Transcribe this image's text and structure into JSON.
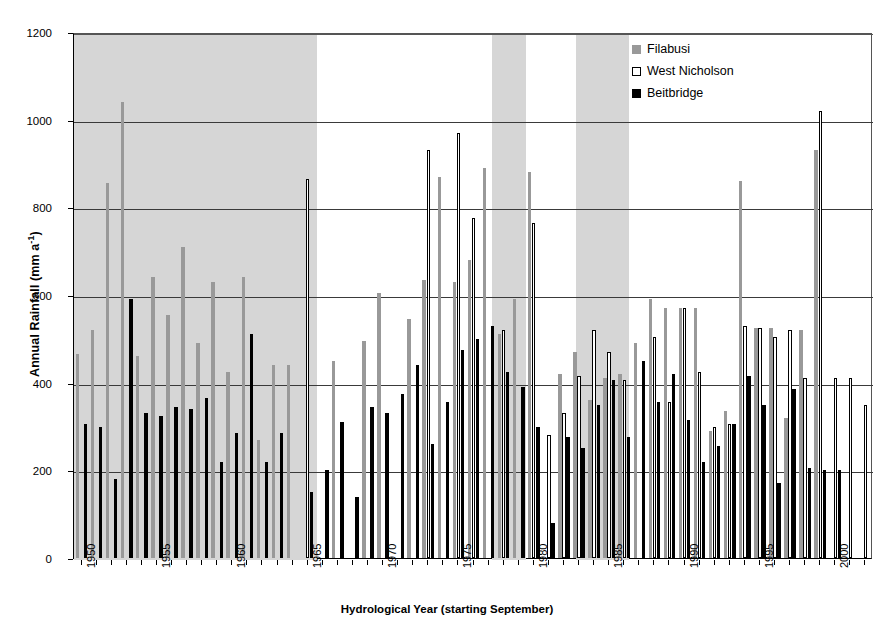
{
  "chart_data": {
    "type": "bar",
    "title": "",
    "xlabel": "Hydrological  Year (starting September)",
    "ylabel": "Annual Rainfall (mm a",
    "ylabel_sup": "-1",
    "ylabel_suffix": ")",
    "ylim": [
      0,
      1200
    ],
    "ytick_values": [
      0,
      200,
      400,
      600,
      800,
      1000,
      1200
    ],
    "ytick_labels": [
      "0",
      "200",
      "400",
      "600",
      "800",
      "1000",
      "1200"
    ],
    "grid": "horizontal",
    "legend_position": "top-right",
    "legend": [
      {
        "name": "Filabusi",
        "color": "#999999"
      },
      {
        "name": "West Nicholson",
        "color": "#ffffff"
      },
      {
        "name": "Beitbridge",
        "color": "#000000"
      }
    ],
    "xlim": [
      1949.5,
      2002.5
    ],
    "x": [
      1950,
      1951,
      1952,
      1953,
      1954,
      1955,
      1956,
      1957,
      1958,
      1959,
      1960,
      1961,
      1962,
      1963,
      1964,
      1965,
      1966,
      1967,
      1968,
      1969,
      1970,
      1971,
      1972,
      1973,
      1974,
      1975,
      1976,
      1977,
      1978,
      1979,
      1980,
      1981,
      1982,
      1983,
      1984,
      1985,
      1986,
      1987,
      1988,
      1989,
      1990,
      1991,
      1992,
      1993,
      1994,
      1995,
      1996,
      1997,
      1998,
      1999,
      2000,
      2001,
      2002
    ],
    "xtick_labels": [
      "1950",
      "1955",
      "1960",
      "1965",
      "1970",
      "1975",
      "1980",
      "1985",
      "1990",
      "1995",
      "2000"
    ],
    "xtick_values": [
      1950,
      1955,
      1960,
      1965,
      1970,
      1975,
      1980,
      1985,
      1990,
      1995,
      2000
    ],
    "shaded_bands": [
      {
        "start": 1949.5,
        "end": 1965.6,
        "label": "wet-period-1",
        "color": "#d6d6d6"
      },
      {
        "start": 1977.2,
        "end": 1979.5,
        "label": "wet-period-2",
        "color": "#d6d6d6"
      },
      {
        "start": 1982.8,
        "end": 1986.3,
        "label": "wet-period-3",
        "color": "#d6d6d6"
      }
    ],
    "series": [
      {
        "name": "Filabusi",
        "color": "#999999",
        "values": [
          465,
          520,
          855,
          1040,
          460,
          640,
          555,
          710,
          490,
          630,
          425,
          640,
          270,
          440,
          440,
          null,
          null,
          450,
          null,
          495,
          605,
          null,
          545,
          635,
          870,
          630,
          680,
          890,
          510,
          590,
          880,
          null,
          420,
          470,
          360,
          410,
          420,
          490,
          590,
          570,
          570,
          570,
          290,
          335,
          860,
          525,
          525,
          320,
          520,
          930,
          null,
          null,
          null
        ]
      },
      {
        "name": "West Nicholson",
        "color": "#ffffff",
        "values": [
          null,
          null,
          null,
          null,
          null,
          null,
          null,
          null,
          null,
          null,
          null,
          null,
          null,
          null,
          null,
          865,
          null,
          null,
          null,
          null,
          null,
          null,
          null,
          930,
          null,
          970,
          775,
          null,
          520,
          null,
          765,
          280,
          330,
          415,
          520,
          470,
          405,
          null,
          505,
          355,
          570,
          425,
          300,
          305,
          530,
          525,
          505,
          520,
          410,
          1020,
          410,
          410,
          350
        ]
      },
      {
        "name": "Beitbridge",
        "color": "#000000",
        "values": [
          305,
          300,
          180,
          590,
          330,
          325,
          345,
          340,
          365,
          220,
          285,
          510,
          220,
          285,
          null,
          150,
          200,
          310,
          140,
          345,
          330,
          375,
          440,
          260,
          355,
          475,
          500,
          530,
          425,
          390,
          300,
          80,
          275,
          250,
          350,
          405,
          275,
          450,
          355,
          420,
          315,
          220,
          255,
          305,
          415,
          350,
          170,
          385,
          205,
          200,
          200,
          null,
          null
        ]
      }
    ]
  }
}
